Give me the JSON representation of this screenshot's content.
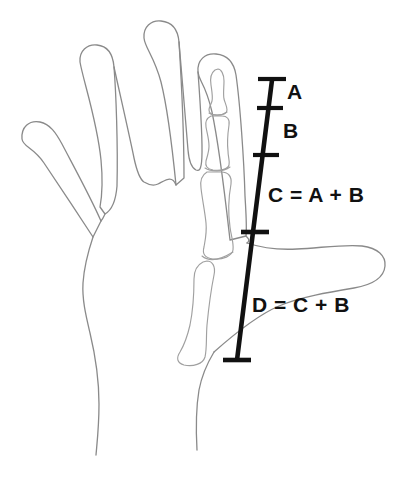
{
  "figure": {
    "background_color": "#ffffff",
    "width": 398,
    "height": 479,
    "outline_color": "#888888",
    "bone_color": "#9a9a9a",
    "scale_color": "#111111"
  },
  "scale_bar": {
    "name": "measurement-scale-bar",
    "orientation": "vertical-tilted",
    "top_point": {
      "x": 272,
      "y": 80
    },
    "bottom_point": {
      "x": 237,
      "y": 360
    },
    "ticks": [
      {
        "id": "tick-top",
        "x": 272,
        "y": 80,
        "half_width": 14,
        "role": "start-cap"
      },
      {
        "id": "tick-a-b",
        "x": 270,
        "y": 108,
        "half_width": 13,
        "role": "divider"
      },
      {
        "id": "tick-b-c",
        "x": 266,
        "y": 155,
        "half_width": 13,
        "role": "divider"
      },
      {
        "id": "tick-c-d",
        "x": 255,
        "y": 232,
        "half_width": 14,
        "role": "divider"
      },
      {
        "id": "tick-bottom",
        "x": 237,
        "y": 360,
        "half_width": 14,
        "role": "end-cap"
      }
    ]
  },
  "annotations": [
    {
      "id": "A",
      "label": "A",
      "segment": "distal phalanx"
    },
    {
      "id": "B",
      "label": "B",
      "segment": "middle phalanx"
    },
    {
      "id": "C",
      "label": "C = A + B",
      "segment": "proximal phalanx"
    },
    {
      "id": "D",
      "label": "D = C + B",
      "segment": "metacarpal"
    }
  ],
  "hand": {
    "view": "palmar outline, left hand",
    "parts": [
      "thumb",
      "index-finger",
      "middle-finger",
      "ring-finger",
      "little-finger",
      "palm",
      "wrist",
      "index-finger-bones"
    ]
  }
}
